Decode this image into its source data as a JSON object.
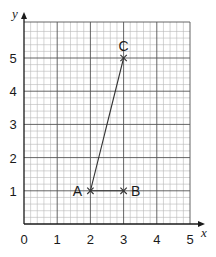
{
  "axes": {
    "x_label": "x",
    "y_label": "y",
    "x_ticks": [
      "0",
      "1",
      "2",
      "3",
      "4",
      "5"
    ],
    "y_ticks": [
      "1",
      "2",
      "3",
      "4",
      "5"
    ]
  },
  "points": [
    {
      "label": "A",
      "x": 2,
      "y": 1
    },
    {
      "label": "B",
      "x": 3,
      "y": 1
    },
    {
      "label": "C",
      "x": 3,
      "y": 5
    }
  ],
  "segments": [
    {
      "from": "A",
      "to": "B"
    },
    {
      "from": "A",
      "to": "C"
    }
  ],
  "colors": {
    "grid_minor": "#b8b8b8",
    "grid_major": "#555555",
    "axis": "#1a1a1a",
    "line": "#333333"
  }
}
